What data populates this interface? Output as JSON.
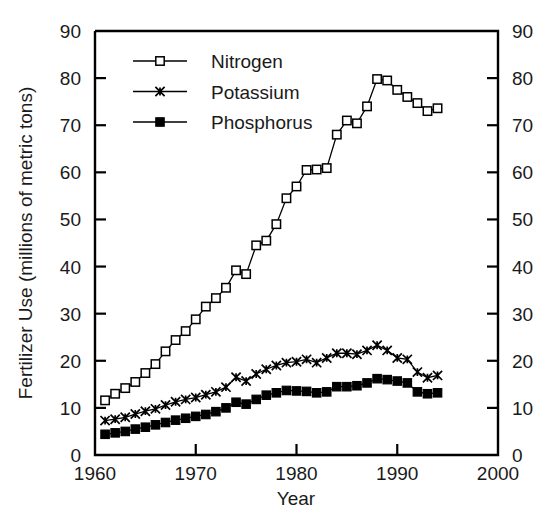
{
  "chart_data": {
    "type": "line",
    "title": "",
    "xlabel": "Year",
    "ylabel": "Fertilizer Use (millions of metric tons)",
    "xlim": [
      1960,
      2000
    ],
    "ylim": [
      0,
      90
    ],
    "xticks": [
      1960,
      1970,
      1980,
      1990,
      2000
    ],
    "yticks": [
      0,
      10,
      20,
      30,
      40,
      50,
      60,
      70,
      80,
      90
    ],
    "grid": false,
    "legend_position": "top-left inside axes",
    "x": [
      1961,
      1962,
      1963,
      1964,
      1965,
      1966,
      1967,
      1968,
      1969,
      1970,
      1971,
      1972,
      1973,
      1974,
      1975,
      1976,
      1977,
      1978,
      1979,
      1980,
      1981,
      1982,
      1983,
      1984,
      1985,
      1986,
      1987,
      1988,
      1989,
      1990,
      1991,
      1992,
      1993,
      1994
    ],
    "series": [
      {
        "name": "Nitrogen",
        "marker": "open-square",
        "values": [
          11.6,
          13.0,
          14.2,
          15.5,
          17.4,
          19.3,
          22.0,
          24.4,
          26.3,
          28.8,
          31.5,
          33.3,
          35.5,
          39.2,
          38.4,
          44.5,
          45.5,
          49.0,
          54.5,
          57.0,
          60.5,
          60.6,
          60.9,
          68.0,
          71.0,
          70.4,
          74.0,
          79.8,
          79.5,
          77.5,
          76.0,
          74.7,
          73.0,
          73.6
        ]
      },
      {
        "name": "Potassium",
        "marker": "x-star",
        "values": [
          7.3,
          7.6,
          8.0,
          8.7,
          9.3,
          9.8,
          10.6,
          11.3,
          11.8,
          12.2,
          12.8,
          13.4,
          14.4,
          16.5,
          15.7,
          17.2,
          18.2,
          19.0,
          19.6,
          19.8,
          20.3,
          19.6,
          20.6,
          21.6,
          21.6,
          21.4,
          22.2,
          23.3,
          22.2,
          20.6,
          20.3,
          17.6,
          16.4,
          16.9
        ]
      },
      {
        "name": "Phosphorus",
        "marker": "filled-square",
        "values": [
          4.4,
          4.7,
          5.0,
          5.5,
          5.9,
          6.4,
          6.9,
          7.4,
          7.8,
          8.2,
          8.6,
          9.2,
          10.0,
          11.2,
          10.8,
          11.8,
          12.7,
          13.2,
          13.7,
          13.6,
          13.5,
          13.2,
          13.4,
          14.5,
          14.5,
          14.7,
          15.3,
          16.2,
          16.0,
          15.7,
          15.3,
          13.4,
          13.0,
          13.2
        ]
      }
    ]
  },
  "legend": {
    "entries": [
      {
        "label": "Nitrogen"
      },
      {
        "label": "Potassium"
      },
      {
        "label": "Phosphorus"
      }
    ]
  },
  "colors": {
    "foreground": "#000000",
    "background": "#ffffff"
  }
}
